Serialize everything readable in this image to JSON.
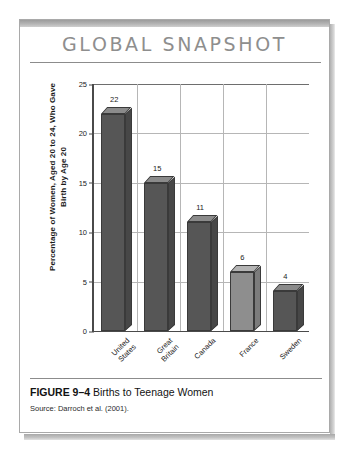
{
  "card": {
    "snapshot_title": "GLOBAL SNAPSHOT",
    "figure_label": "FIGURE 9–4",
    "figure_title": "Births to Teenage Women",
    "source": "Source: Darroch et al. (2001)."
  },
  "colors": {
    "bar_dark_front": "#565656",
    "bar_dark_top": "#8b8b8b",
    "bar_dark_side": "#474747",
    "bar_light_front": "#8e8e8e",
    "bar_light_top": "#b4b4b4",
    "bar_light_side": "#7c7c7c",
    "gridline": "#b6b6b6",
    "axis": "#4a4a4a",
    "title_gray": "#8e8e8e"
  },
  "chart_data": {
    "type": "bar",
    "title": "Births to Teenage Women",
    "categories": [
      "United States",
      "Great Britain",
      "Canada",
      "France",
      "Sweden"
    ],
    "values": [
      22,
      15,
      11,
      6,
      4
    ],
    "bar_styles": [
      "dark",
      "dark",
      "dark",
      "light",
      "dark"
    ],
    "xlabel": "",
    "ylabel": "Percentage of Women, Aged 20 to 24, Who Gave Birth by Age 20",
    "ylim": [
      0,
      25
    ],
    "yticks": [
      0,
      5,
      10,
      15,
      20,
      25
    ],
    "ytick_labels": [
      "0",
      "5",
      "10",
      "15",
      "20",
      "25"
    ],
    "grid": true,
    "legend": false,
    "data_labels": [
      "22",
      "15",
      "11",
      "6",
      "4"
    ]
  }
}
